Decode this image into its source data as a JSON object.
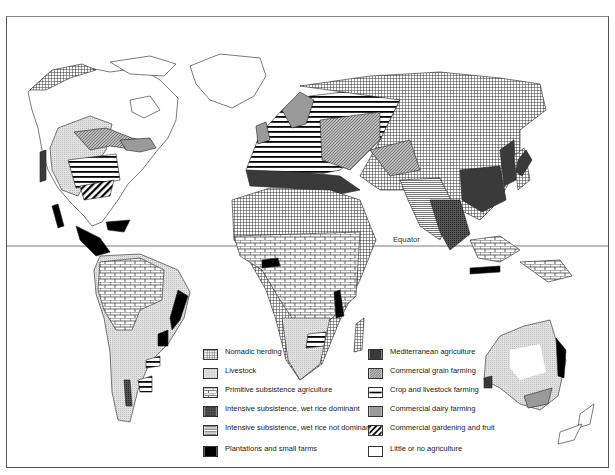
{
  "map": {
    "title": "World agricultural regions",
    "equator_label": "Equator",
    "colors": {
      "border": "#555555",
      "land_outline": "#222222",
      "livestock_fill": "#d8d8d8",
      "mediterranean_fill": "#3a3a3a",
      "dairy_fill": "#9a9a9a",
      "plantation_fill": "#000000"
    }
  },
  "legend": {
    "left": [
      {
        "label": "Nomadic herding",
        "pattern": "grid"
      },
      {
        "label": "Livestock",
        "pattern": "light-stipple"
      },
      {
        "label": "Primitive subsistence agriculture",
        "pattern": "brick"
      },
      {
        "label": "Intensive subsistence, wet rice dominant",
        "pattern": "dark-crosshatch"
      },
      {
        "label": "Intensive subsistence, wet rice not dominant",
        "pattern": "fine-horizontal-lines"
      },
      {
        "label": "Plantations and small farms",
        "pattern": "solid-black"
      }
    ],
    "right": [
      {
        "label": "Mediterranean agriculture",
        "pattern": "solid-dark-gray"
      },
      {
        "label": "Commercial grain farming",
        "pattern": "diagonal-hatch"
      },
      {
        "label": "Crop and livestock farming",
        "pattern": "thick-horizontal-bars"
      },
      {
        "label": "Commercial dairy farming",
        "pattern": "solid-mid-gray"
      },
      {
        "label": "Commercial gardening and fruit",
        "pattern": "bold-diagonal-stripes"
      },
      {
        "label": "Little or no agriculture",
        "pattern": "blank"
      }
    ]
  }
}
